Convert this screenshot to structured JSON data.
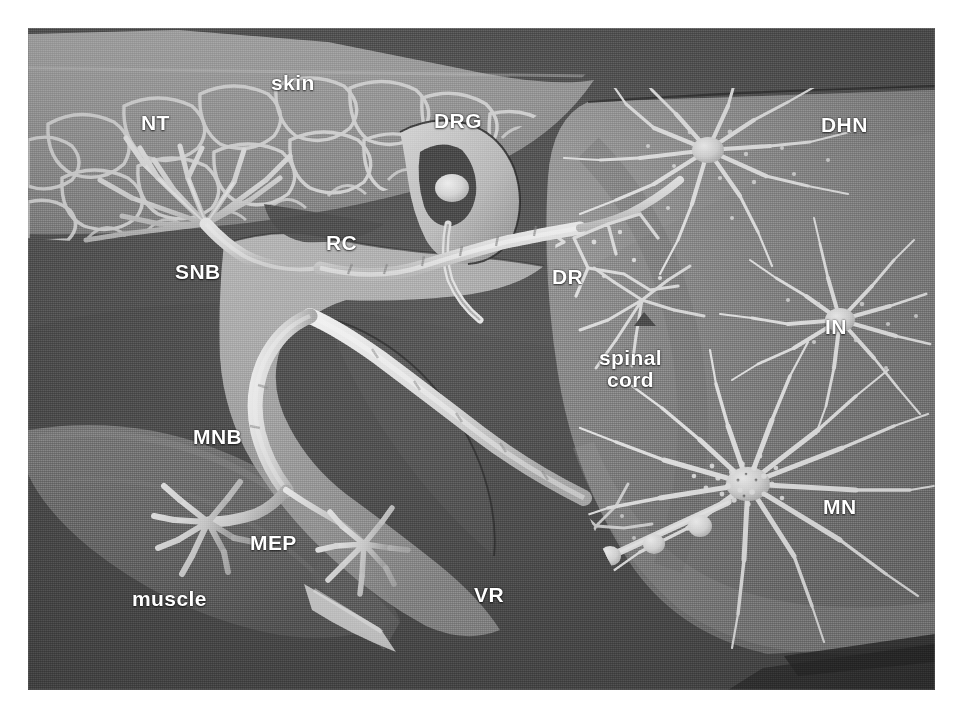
{
  "figure": {
    "kind": "anatomical-illustration",
    "canvas": {
      "width": 963,
      "height": 720
    },
    "plate": {
      "x": 28,
      "y": 28,
      "width": 907,
      "height": 662
    },
    "background_color": "#ffffff"
  },
  "palette": {
    "page_white": "#ffffff",
    "dark_field": "#5a5a5a",
    "mid_field": "#6e6e6e",
    "muscle_gray": "#7c7c7c",
    "cord_gray": "#8c8c8c",
    "cord_light": "#9b9b9b",
    "skin_light": "#a9a9a9",
    "nerve_white": "#ececec",
    "nerve_bright": "#f5f5f5",
    "shadow_dark": "#3d3d3d",
    "label_color": "#ffffff"
  },
  "labels": [
    {
      "id": "skin",
      "text": "skin",
      "case": "lower",
      "x": 243,
      "y": 44,
      "size": 21,
      "lines": 1
    },
    {
      "id": "nt",
      "text": "NT",
      "case": "upper",
      "x": 113,
      "y": 84,
      "size": 21,
      "lines": 1
    },
    {
      "id": "drg",
      "text": "DRG",
      "case": "upper",
      "x": 406,
      "y": 82,
      "size": 21,
      "lines": 1
    },
    {
      "id": "dhn",
      "text": "DHN",
      "case": "upper",
      "x": 793,
      "y": 86,
      "size": 21,
      "lines": 1
    },
    {
      "id": "rc",
      "text": "RC",
      "case": "upper",
      "x": 298,
      "y": 204,
      "size": 21,
      "lines": 1
    },
    {
      "id": "snb",
      "text": "SNB",
      "case": "upper",
      "x": 147,
      "y": 233,
      "size": 21,
      "lines": 1
    },
    {
      "id": "dr",
      "text": "DR",
      "case": "upper",
      "x": 524,
      "y": 238,
      "size": 21,
      "lines": 1
    },
    {
      "id": "in",
      "text": "IN",
      "case": "upper",
      "x": 797,
      "y": 288,
      "size": 21,
      "lines": 1
    },
    {
      "id": "spinal-cord",
      "text": "spinal\ncord",
      "case": "lower",
      "x": 571,
      "y": 319,
      "size": 21,
      "lines": 2
    },
    {
      "id": "mnb",
      "text": "MNB",
      "case": "upper",
      "x": 165,
      "y": 398,
      "size": 21,
      "lines": 1
    },
    {
      "id": "mep",
      "text": "MEP",
      "case": "upper",
      "x": 222,
      "y": 504,
      "size": 21,
      "lines": 1
    },
    {
      "id": "mn",
      "text": "MN",
      "case": "upper",
      "x": 795,
      "y": 468,
      "size": 21,
      "lines": 1
    },
    {
      "id": "vr",
      "text": "VR",
      "case": "upper",
      "x": 446,
      "y": 556,
      "size": 21,
      "lines": 1
    },
    {
      "id": "muscle",
      "text": "muscle",
      "case": "lower",
      "x": 104,
      "y": 560,
      "size": 21,
      "lines": 1
    }
  ],
  "legend_expansions": {
    "NT": "nerve terminal",
    "SNB": "sensory nerve branch",
    "DRG": "dorsal root ganglion",
    "RC": "ramus communicans",
    "DR": "dorsal root",
    "DHN": "dorsal horn neuron",
    "IN": "interneuron",
    "MN": "motor neuron",
    "VR": "ventral root",
    "MNB": "motor nerve branch",
    "MEP": "motor end plate"
  },
  "structures": [
    {
      "name": "skin",
      "region": "upper-left band",
      "tone": "#a9a9a9"
    },
    {
      "name": "nerve-terminal-tree",
      "region": "upper-left",
      "tone": "#ececec"
    },
    {
      "name": "sensory-nerve-branch",
      "region": "left-center",
      "tone": "#e2e2e2"
    },
    {
      "name": "ramus-communicans",
      "region": "center",
      "tone": "#c9c9c9"
    },
    {
      "name": "dorsal-root-ganglion",
      "region": "top-center",
      "tone": "#d6d6d6"
    },
    {
      "name": "dorsal-root",
      "region": "center-right",
      "tone": "#ececec"
    },
    {
      "name": "ventral-root",
      "region": "lower-center",
      "tone": "#ececec"
    },
    {
      "name": "motor-nerve-branch",
      "region": "lower-left",
      "tone": "#ececec"
    },
    {
      "name": "motor-end-plate",
      "region": "lower-left",
      "tone": "#f0f0f0"
    },
    {
      "name": "muscle",
      "region": "lower-left",
      "tone": "#7c7c7c"
    },
    {
      "name": "spinal-cord",
      "region": "right half",
      "tone": "#8c8c8c"
    },
    {
      "name": "dorsal-horn-neuron",
      "region": "upper-right",
      "tone": "#ededed"
    },
    {
      "name": "interneuron",
      "region": "mid-right",
      "tone": "#ededed"
    },
    {
      "name": "motor-neuron",
      "region": "lower-right",
      "tone": "#ededed"
    }
  ]
}
